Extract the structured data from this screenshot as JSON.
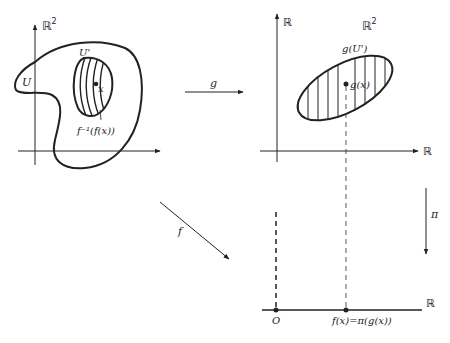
{
  "diagram": {
    "colors": {
      "ink": "#222222",
      "background": "#ffffff"
    },
    "left_plane": {
      "space_label": "ℝ",
      "space_exp": "2",
      "region_U": "U",
      "region_U_prime": "U'",
      "point_x": "x",
      "fiber_label": "f⁻¹(f(x))"
    },
    "arrow_g": {
      "label": "g"
    },
    "arrow_f": {
      "label": "f"
    },
    "right_plane": {
      "y_axis_label": "ℝ",
      "x_axis_label": "ℝ",
      "space_label": "ℝ",
      "space_exp": "2",
      "image_label": "g(U')",
      "point_label": "g(x)"
    },
    "projection": {
      "label": "π"
    },
    "bottom_line": {
      "axis_label": "ℝ",
      "origin_label": "O",
      "value_label": "f(x)=π(g(x))"
    }
  }
}
